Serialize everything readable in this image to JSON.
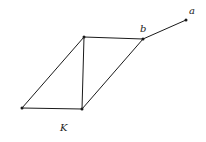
{
  "diagram": {
    "labels": {
      "a": "a",
      "b": "b",
      "K": "K"
    },
    "vertices": [
      {
        "id": "top-left",
        "x": 84,
        "y": 37
      },
      {
        "id": "b",
        "x": 143,
        "y": 39
      },
      {
        "id": "a",
        "x": 186,
        "y": 20
      },
      {
        "id": "bottom-left",
        "x": 22,
        "y": 108
      },
      {
        "id": "bottom-right",
        "x": 82,
        "y": 109
      }
    ],
    "edges": [
      [
        "top-left",
        "b"
      ],
      [
        "top-left",
        "bottom-left"
      ],
      [
        "top-left",
        "bottom-right"
      ],
      [
        "bottom-left",
        "bottom-right"
      ],
      [
        "bottom-right",
        "b"
      ],
      [
        "b",
        "a"
      ]
    ]
  }
}
